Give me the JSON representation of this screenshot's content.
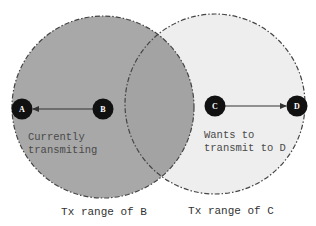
{
  "diagram": {
    "type": "hidden-terminal / exposed-terminal wireless range diagram",
    "colors": {
      "range_b_fill": "#a8a8a8",
      "range_c_fill": "#eeeeee",
      "overlap_fill": "#a3a3a3",
      "circle_stroke": "#444444",
      "node_fill": "#111111",
      "node_text": "#ffffff",
      "arrow": "#333333"
    },
    "ranges": [
      {
        "id": "B",
        "cx": 103,
        "cy": 107,
        "r": 91,
        "caption": "Tx range of B"
      },
      {
        "id": "C",
        "cx": 215,
        "cy": 104,
        "r": 90,
        "caption": "Tx range of C"
      }
    ],
    "nodes": [
      {
        "id": "A",
        "label": "A",
        "cx": 22,
        "cy": 109
      },
      {
        "id": "B",
        "label": "B",
        "cx": 103,
        "cy": 109
      },
      {
        "id": "C",
        "label": "C",
        "cx": 215,
        "cy": 106
      },
      {
        "id": "D",
        "label": "D",
        "cx": 297,
        "cy": 106
      }
    ],
    "edges": [
      {
        "from": "B",
        "to": "A",
        "directed": true
      },
      {
        "from": "C",
        "to": "D",
        "directed": true
      }
    ],
    "annotations": {
      "b_status_line1": "Currently",
      "b_status_line2": "transmiting",
      "c_status_line1": "Wants to",
      "c_status_line2": "transmit to D"
    },
    "captions": {
      "range_b": "Tx range of B",
      "range_c": "Tx range of C"
    }
  }
}
